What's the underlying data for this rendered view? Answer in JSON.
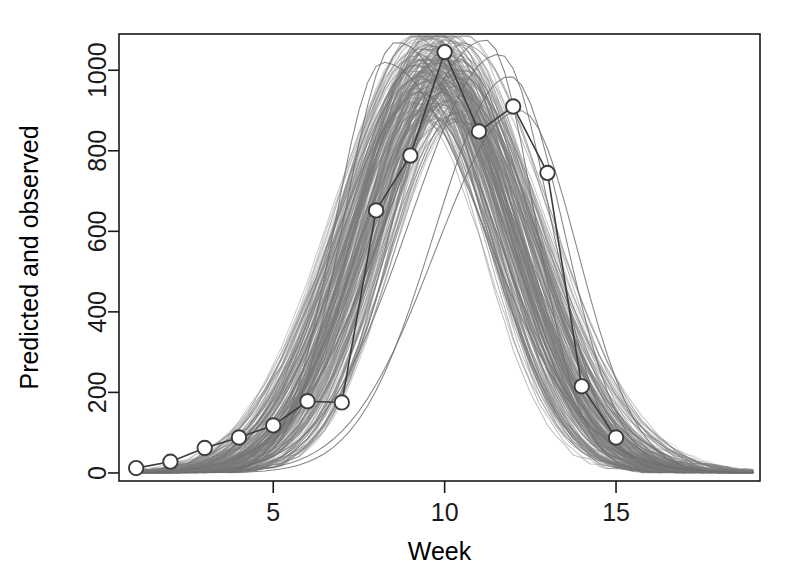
{
  "chart_data": {
    "type": "line",
    "title": "",
    "subtitle": "",
    "xlabel": "Week",
    "ylabel": "Predicted and observed",
    "xlim": [
      0.5,
      19.2
    ],
    "ylim": [
      -20,
      1090
    ],
    "xticks": [
      5,
      10,
      15
    ],
    "yticks": [
      0,
      200,
      400,
      600,
      800,
      1000
    ],
    "xtick_labels": [
      "5",
      "10",
      "15"
    ],
    "ytick_labels": [
      "0",
      "200",
      "400",
      "600",
      "800",
      "1000"
    ],
    "grid": false,
    "legend": false,
    "legend_position": "none",
    "colors": {
      "predicted_band": "#7a7a7a",
      "observed_line": "#3c3c3c",
      "observed_marker_stroke": "#3c3c3c",
      "observed_marker_fill": "#ffffff",
      "axis": "#1a1a1a",
      "background": "#ffffff"
    },
    "x": [
      1,
      2,
      3,
      4,
      5,
      6,
      7,
      8,
      9,
      10,
      11,
      12,
      13,
      14,
      15
    ],
    "series": [
      {
        "name": "Observed",
        "style": "line-with-open-circles",
        "values": [
          12,
          28,
          62,
          88,
          118,
          178,
          175,
          652,
          788,
          1045,
          848,
          910,
          745,
          215,
          88
        ]
      }
    ],
    "predicted_ensemble": {
      "name": "Predicted simulations",
      "n_curves": 200,
      "description": "Grey ensemble of simulated epidemic trajectories peaking near week 10",
      "x": [
        1,
        2,
        3,
        4,
        5,
        6,
        7,
        8,
        9,
        10,
        11,
        12,
        13,
        14,
        15,
        16,
        17,
        18,
        19
      ],
      "median": [
        14,
        30,
        62,
        100,
        160,
        255,
        410,
        640,
        900,
        1040,
        930,
        700,
        440,
        250,
        140,
        80,
        48,
        30,
        20
      ],
      "lower": [
        8,
        16,
        32,
        52,
        85,
        135,
        215,
        350,
        560,
        760,
        560,
        330,
        175,
        90,
        48,
        26,
        15,
        10,
        6
      ],
      "upper": [
        20,
        44,
        92,
        152,
        245,
        400,
        640,
        950,
        1070,
        1080,
        1075,
        1000,
        760,
        480,
        280,
        160,
        95,
        60,
        40
      ]
    }
  },
  "axes": {
    "x_axis_label": "Week",
    "y_axis_label": "Predicted and observed"
  }
}
